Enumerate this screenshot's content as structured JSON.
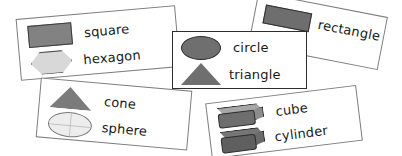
{
  "scene": {
    "title": "Geometry shape flashcards",
    "background_color": "#ffffff",
    "width": 402,
    "height": 156
  },
  "cards": [
    {
      "id": "card-square-hexagon",
      "rotation_deg": -5,
      "entries": [
        {
          "label": "square",
          "shape": "square-icon",
          "fill": "#828282"
        },
        {
          "label": "hexagon",
          "shape": "hexagon-icon",
          "fill": "#d8d8d8"
        }
      ]
    },
    {
      "id": "card-rectangle",
      "rotation_deg": 11,
      "entries": [
        {
          "label": "rectangle",
          "shape": "rectangle-icon",
          "fill": "#6e6e6e"
        }
      ]
    },
    {
      "id": "card-circle-triangle",
      "rotation_deg": 0,
      "entries": [
        {
          "label": "circle",
          "shape": "circle-icon",
          "fill": "#6f6f6f"
        },
        {
          "label": "triangle",
          "shape": "triangle-icon",
          "fill": "#6f6f6f"
        }
      ]
    },
    {
      "id": "card-cone-sphere",
      "rotation_deg": 5,
      "entries": [
        {
          "label": "cone",
          "shape": "cone-icon",
          "fill": "#7b7b7b"
        },
        {
          "label": "sphere",
          "shape": "sphere-icon",
          "fill": "#ededed"
        }
      ]
    },
    {
      "id": "card-cube-cylinder",
      "rotation_deg": -7,
      "entries": [
        {
          "label": "cube",
          "shape": "cube-icon",
          "fill": "#a7a7a7"
        },
        {
          "label": "cylinder",
          "shape": "cylinder-icon",
          "fill": "#5f5f5f"
        }
      ]
    }
  ]
}
